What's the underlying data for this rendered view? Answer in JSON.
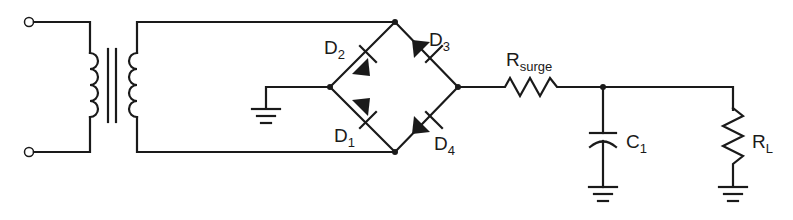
{
  "diagram": {
    "type": "circuit-schematic",
    "components": [
      {
        "id": "T1",
        "kind": "transformer",
        "label": ""
      },
      {
        "id": "D1",
        "kind": "diode",
        "label": "D",
        "sub": "1"
      },
      {
        "id": "D2",
        "kind": "diode",
        "label": "D",
        "sub": "2"
      },
      {
        "id": "D3",
        "kind": "diode",
        "label": "D",
        "sub": "3"
      },
      {
        "id": "D4",
        "kind": "diode",
        "label": "D",
        "sub": "4"
      },
      {
        "id": "Rsurge",
        "kind": "resistor",
        "label": "R",
        "sub": "surge"
      },
      {
        "id": "C1",
        "kind": "capacitor",
        "label": "C",
        "sub": "1"
      },
      {
        "id": "RL",
        "kind": "resistor",
        "label": "R",
        "sub": "L"
      }
    ],
    "labels": {
      "d1": {
        "main": "D",
        "sub": "1"
      },
      "d2": {
        "main": "D",
        "sub": "2"
      },
      "d3": {
        "main": "D",
        "sub": "3"
      },
      "d4": {
        "main": "D",
        "sub": "4"
      },
      "rsurge": {
        "main": "R",
        "sub": "surge"
      },
      "c1": {
        "main": "C",
        "sub": "1"
      },
      "rl": {
        "main": "R",
        "sub": "L"
      }
    },
    "grounds": 3,
    "input_terminals": 2
  }
}
